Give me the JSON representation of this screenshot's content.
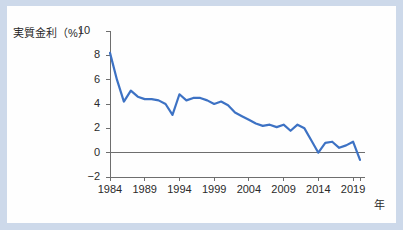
{
  "card": {
    "frame_color": "#cdd9ea",
    "background": "#ffffff"
  },
  "chart_data": {
    "type": "line",
    "title": "",
    "ylabel": "実質金利（%）",
    "ylabel_unit_suffix": "",
    "xlabel": "年",
    "ylim": [
      -2,
      10
    ],
    "xlim": [
      1984,
      2020
    ],
    "grid": false,
    "legend": "none",
    "line_color": "#3d72c4",
    "axis_color": "#6e6e6e",
    "zero_line": 0,
    "yticks": [
      10,
      8,
      6,
      4,
      2,
      0,
      -2
    ],
    "ytick_labels": [
      "10",
      "8",
      "6",
      "4",
      "2",
      "0",
      "−2"
    ],
    "xticks": [
      1984,
      1989,
      1994,
      1999,
      2004,
      2009,
      2014,
      2019
    ],
    "xtick_labels": [
      "1984",
      "1989",
      "1994",
      "1999",
      "2004",
      "2009",
      "2014",
      "2019"
    ],
    "x": [
      1984,
      1985,
      1986,
      1987,
      1988,
      1989,
      1990,
      1991,
      1992,
      1993,
      1994,
      1995,
      1996,
      1997,
      1998,
      1999,
      2000,
      2001,
      2002,
      2003,
      2004,
      2005,
      2006,
      2007,
      2008,
      2009,
      2010,
      2011,
      2012,
      2013,
      2014,
      2015,
      2016,
      2017,
      2018,
      2019,
      2020
    ],
    "values": [
      8.2,
      6.0,
      4.2,
      5.1,
      4.6,
      4.4,
      4.4,
      4.3,
      4.0,
      3.1,
      4.8,
      4.3,
      4.5,
      4.5,
      4.3,
      4.0,
      4.2,
      3.9,
      3.3,
      3.0,
      2.7,
      2.4,
      2.2,
      2.3,
      2.1,
      2.3,
      1.8,
      2.3,
      2.0,
      1.0,
      0.0,
      0.8,
      0.9,
      0.4,
      0.6,
      0.9,
      -0.6
    ],
    "series_name": "実質金利"
  }
}
